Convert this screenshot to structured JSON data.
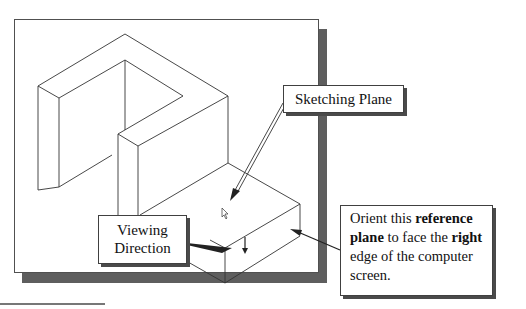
{
  "figure": {
    "type": "isometric-part-diagram",
    "colors": {
      "line": "#333333",
      "panel_border": "#505050",
      "panel_shadow": "#5e5e5e",
      "callout_shadow": "#4a4a4a",
      "background": "#ffffff"
    }
  },
  "callouts": {
    "sketching_plane": {
      "label": "Sketching Plane"
    },
    "viewing_direction": {
      "line1": "Viewing",
      "line2": "Direction"
    },
    "orient": {
      "t1": "Orient this ",
      "b1": "reference",
      "b2": "plane",
      "t2": " to face the ",
      "b3": "right",
      "t3": "edge of the computer",
      "t4": "screen."
    }
  },
  "icons": {
    "cursor": "mouse-pointer-arrow",
    "view_arrow": "down-arrow"
  }
}
